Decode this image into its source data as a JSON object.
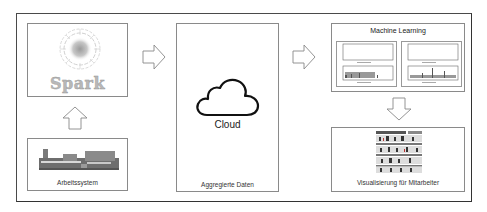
{
  "diagram": {
    "spark_panel": {
      "logo_text": "Spark",
      "icon": "spark-logo-icon"
    },
    "work_system_panel": {
      "label": "Arbeitssystem",
      "icon": "machine-part-icon"
    },
    "cloud_panel": {
      "cloud_label": "Cloud",
      "label": "Aggregierte Daten",
      "icon": "cloud-icon"
    },
    "ml_panel": {
      "title": "Machine Learning",
      "charts": [
        {
          "name": "chart-left",
          "icon": "plot-icon"
        },
        {
          "name": "chart-right",
          "icon": "plot-icon"
        }
      ]
    },
    "visualization_panel": {
      "label": "Visualisierung für Mitarbeiter",
      "icon": "worker-visualization-icon"
    },
    "arrows": [
      {
        "from": "work_system_panel",
        "to": "spark_panel",
        "direction": "up"
      },
      {
        "from": "spark_panel",
        "to": "cloud_panel",
        "direction": "right"
      },
      {
        "from": "cloud_panel",
        "to": "ml_panel",
        "direction": "right"
      },
      {
        "from": "ml_panel",
        "to": "visualization_panel",
        "direction": "down"
      }
    ],
    "colors": {
      "frame": "#4a4a4a",
      "box_border": "#8a8a8a",
      "arrow_stroke": "#888888",
      "spark_text": "#b8b8b8"
    }
  }
}
